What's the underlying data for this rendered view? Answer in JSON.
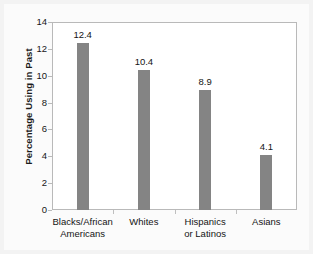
{
  "chart_data": {
    "type": "bar",
    "title": "",
    "subtitle": "",
    "xlabel": "",
    "ylabel": "Percentage Using in Past",
    "ylim": [
      0,
      14
    ],
    "yticks": [
      "0",
      "2",
      "4",
      "6",
      "8",
      "10",
      "12",
      "14"
    ],
    "grid": false,
    "legend": null,
    "categories": [
      "Blacks/African Americans",
      "Whites",
      "Hispanics or Latinos",
      "Asians"
    ],
    "category_lines": [
      [
        "Blacks/African",
        "Americans"
      ],
      [
        "Whites",
        ""
      ],
      [
        "Hispanics",
        "or Latinos"
      ],
      [
        "Asians",
        ""
      ]
    ],
    "values": [
      12.4,
      10.4,
      8.9,
      4.1
    ],
    "value_labels": [
      "12.4",
      "10.4",
      "8.9",
      "4.1"
    ],
    "bar_color": "#848484",
    "plot_background": "#ffffff",
    "figure_background": "#f3f3f3",
    "axis_color": "#b9b9b9",
    "text_color": "#141414"
  }
}
